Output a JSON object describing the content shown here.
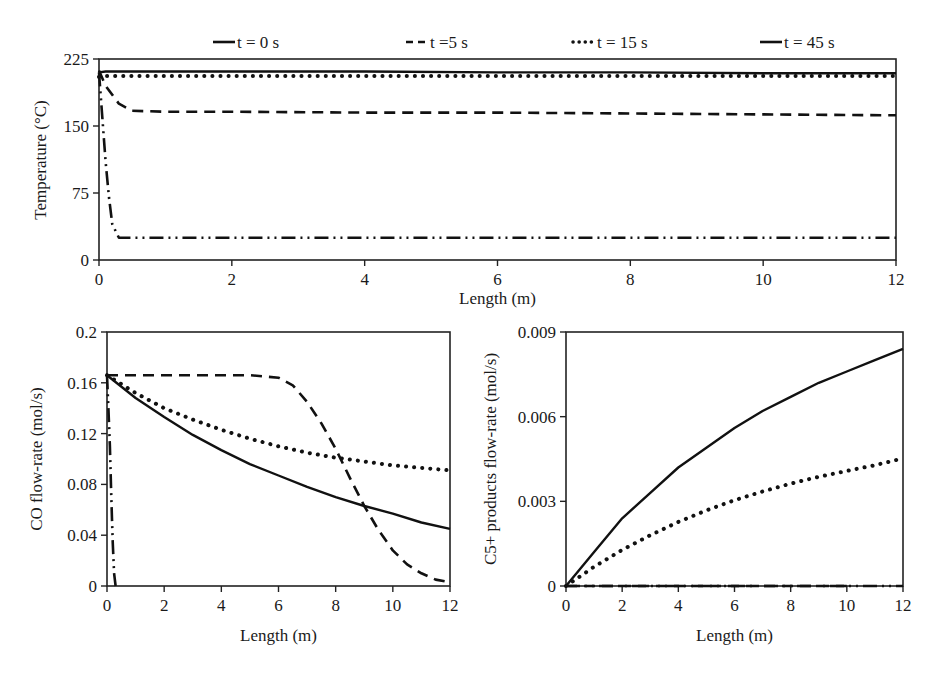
{
  "legend": [
    {
      "label": "t = 0 s",
      "style": "dashdotdot"
    },
    {
      "label": "-t =5 s",
      "style": "dashed"
    },
    {
      "label": "t = 15 s",
      "style": "dotted"
    },
    {
      "label": "t = 45 s",
      "style": "solid"
    }
  ],
  "chart_data": [
    {
      "type": "line",
      "title": "",
      "xlabel": "Length (m)",
      "ylabel": "Temperature (°C)",
      "xlim": [
        0,
        12
      ],
      "ylim": [
        0,
        225
      ],
      "xticks": [
        0,
        2,
        4,
        6,
        8,
        10,
        12
      ],
      "yticks": [
        0,
        75,
        150,
        225
      ],
      "grid": false,
      "legend_position": "top",
      "series": [
        {
          "name": "t = 0 s",
          "x": [
            0,
            0.05,
            0.1,
            0.15,
            0.2,
            0.3,
            12
          ],
          "y": [
            210,
            160,
            110,
            70,
            40,
            25,
            25
          ]
        },
        {
          "name": "t =5 s",
          "x": [
            0,
            0.1,
            0.3,
            0.5,
            1,
            2,
            4,
            6,
            8,
            10,
            12
          ],
          "y": [
            212,
            195,
            175,
            167,
            166,
            166,
            165,
            165,
            164,
            163,
            162
          ]
        },
        {
          "name": "t = 15 s",
          "x": [
            0,
            0.1,
            1,
            2,
            4,
            6,
            8,
            10,
            12
          ],
          "y": [
            205,
            206,
            206,
            206,
            206,
            206,
            206,
            206,
            206
          ]
        },
        {
          "name": "t = 45 s",
          "x": [
            0,
            0.1,
            1,
            2,
            4,
            6,
            8,
            10,
            12
          ],
          "y": [
            210,
            211,
            211,
            211,
            211,
            210,
            210,
            209,
            209
          ]
        }
      ]
    },
    {
      "type": "line",
      "title": "",
      "xlabel": "Length (m)",
      "ylabel": "CO flow-rate (mol/s)",
      "xlim": [
        0,
        12
      ],
      "ylim": [
        0,
        0.2
      ],
      "xticks": [
        0,
        2,
        4,
        6,
        8,
        10,
        12
      ],
      "yticks": [
        0,
        0.04,
        0.08,
        0.12,
        0.16,
        0.2
      ],
      "grid": false,
      "series": [
        {
          "name": "t = 0 s",
          "x": [
            0,
            0.05,
            0.1,
            0.15,
            0.2,
            0.25,
            0.3
          ],
          "y": [
            0.166,
            0.14,
            0.11,
            0.07,
            0.035,
            0.01,
            0
          ]
        },
        {
          "name": "t =5 s",
          "x": [
            0,
            2,
            4,
            5,
            6,
            6.5,
            7,
            7.5,
            8,
            8.5,
            9,
            9.5,
            10,
            10.5,
            11,
            11.5,
            12
          ],
          "y": [
            0.166,
            0.166,
            0.166,
            0.166,
            0.164,
            0.158,
            0.145,
            0.128,
            0.108,
            0.085,
            0.063,
            0.044,
            0.028,
            0.017,
            0.01,
            0.005,
            0.003
          ]
        },
        {
          "name": "t = 15 s",
          "x": [
            0,
            1,
            2,
            3,
            4,
            5,
            6,
            7,
            8,
            9,
            10,
            11,
            12
          ],
          "y": [
            0.166,
            0.152,
            0.14,
            0.131,
            0.123,
            0.116,
            0.11,
            0.105,
            0.101,
            0.098,
            0.095,
            0.093,
            0.091
          ]
        },
        {
          "name": "t = 45 s",
          "x": [
            0,
            1,
            2,
            3,
            4,
            5,
            6,
            7,
            8,
            9,
            10,
            11,
            12
          ],
          "y": [
            0.166,
            0.148,
            0.133,
            0.119,
            0.107,
            0.096,
            0.087,
            0.078,
            0.07,
            0.063,
            0.057,
            0.05,
            0.045
          ]
        }
      ]
    },
    {
      "type": "line",
      "title": "",
      "xlabel": "Length (m)",
      "ylabel": "C5+ products flow-rate (mol/s)",
      "xlim": [
        0,
        12
      ],
      "ylim": [
        0,
        0.009
      ],
      "xticks": [
        0,
        2,
        4,
        6,
        8,
        10,
        12
      ],
      "yticks": [
        0,
        0.003,
        0.006,
        0.009
      ],
      "grid": false,
      "series": [
        {
          "name": "t = 0 s",
          "x": [
            0,
            12
          ],
          "y": [
            0,
            0
          ]
        },
        {
          "name": "t =5 s",
          "x": [
            0,
            2,
            4,
            6,
            8,
            10
          ],
          "y": [
            0,
            0,
            0,
            0,
            0,
            0
          ]
        },
        {
          "name": "t = 15 s",
          "x": [
            0,
            1,
            2,
            3,
            4,
            5,
            6,
            7,
            8,
            9,
            10,
            11,
            12
          ],
          "y": [
            0,
            0.00068,
            0.00128,
            0.0018,
            0.00227,
            0.00268,
            0.00304,
            0.00335,
            0.00363,
            0.00387,
            0.00408,
            0.00428,
            0.00452
          ]
        },
        {
          "name": "t = 45 s",
          "x": [
            0,
            1,
            2,
            3,
            4,
            5,
            6,
            7,
            8,
            9,
            10,
            11,
            12
          ],
          "y": [
            0,
            0.0012,
            0.0024,
            0.0033,
            0.0042,
            0.0049,
            0.0056,
            0.0062,
            0.0067,
            0.0072,
            0.0076,
            0.008,
            0.0084
          ]
        }
      ]
    }
  ]
}
